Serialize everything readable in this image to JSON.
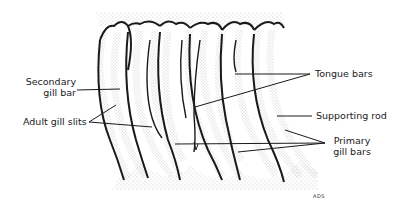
{
  "diagram": {
    "labels": {
      "secondary_gill_bar_line1": "Secondary",
      "secondary_gill_bar_line2": "gill bar",
      "adult_gill_slits": "Adult gill slits",
      "tongue_bars": "Tongue bars",
      "supporting_rod": "Supporting rod",
      "primary_gill_bars_line1": "Primary",
      "primary_gill_bars_line2": "gill bars"
    },
    "signature": "ADS",
    "colors": {
      "ink": "#1a1a1a",
      "stipple": "#9a9a9a",
      "background": "#ffffff"
    }
  }
}
